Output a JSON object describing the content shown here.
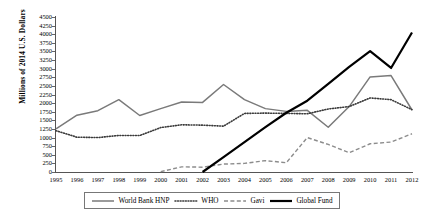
{
  "chart_data": {
    "type": "line",
    "title": "",
    "xlabel": "",
    "ylabel": "Millions of 2014 U.S. Dollars",
    "ylim": [
      0,
      4500
    ],
    "ytick_step": 250,
    "grid": false,
    "legend_position": "bottom",
    "categories": [
      1995,
      1996,
      1997,
      1998,
      1999,
      2000,
      2001,
      2002,
      2003,
      2004,
      2005,
      2006,
      2007,
      2008,
      2009,
      2010,
      2011,
      2012
    ],
    "yticks": [
      "4500",
      "4250",
      "4000",
      "3750",
      "3500",
      "3250",
      "3000",
      "2750",
      "2500",
      "2250",
      "2000",
      "1750",
      "1500",
      "1250",
      "1000",
      "750",
      "500",
      "250",
      "0"
    ],
    "xticks": [
      "1995",
      "1996",
      "1997",
      "1998",
      "1999",
      "2000",
      "2001",
      "2002",
      "2003",
      "2004",
      "2005",
      "2006",
      "2007",
      "2008",
      "2009",
      "2010",
      "2011",
      "2012"
    ],
    "series": [
      {
        "name": "World Bank HNP",
        "style": "solid",
        "color": "#7a7a7a",
        "width": 1.5,
        "values": [
          1250,
          1650,
          1780,
          2100,
          1640,
          1840,
          2030,
          2020,
          2540,
          2100,
          1840,
          1760,
          1790,
          1300,
          1900,
          2760,
          2800,
          1800
        ]
      },
      {
        "name": "WHO",
        "style": "dotted",
        "color": "#3a3a3a",
        "width": 1.6,
        "values": [
          1200,
          1010,
          1000,
          1060,
          1060,
          1290,
          1370,
          1360,
          1330,
          1700,
          1710,
          1700,
          1690,
          1830,
          1900,
          2150,
          2100,
          1810
        ]
      },
      {
        "name": "Gavi",
        "style": "dashed",
        "color": "#8c8c8c",
        "width": 1.4,
        "values": [
          null,
          null,
          null,
          null,
          null,
          10,
          150,
          140,
          230,
          250,
          330,
          270,
          1000,
          800,
          560,
          820,
          870,
          1110
        ]
      },
      {
        "name": "Global Fund",
        "style": "solid",
        "color": "#000000",
        "width": 2.2,
        "values": [
          null,
          null,
          null,
          null,
          null,
          null,
          null,
          0,
          430,
          870,
          1300,
          1720,
          2070,
          2560,
          3050,
          3510,
          3020,
          4050
        ]
      }
    ]
  },
  "legend": {
    "items": [
      {
        "label": "World Bank HNP",
        "icon": "line-solid-gray-icon"
      },
      {
        "label": "WHO",
        "icon": "line-dotted-icon"
      },
      {
        "label": "Gavi",
        "icon": "line-dashed-icon"
      },
      {
        "label": "Global Fund",
        "icon": "line-solid-black-icon"
      }
    ]
  }
}
